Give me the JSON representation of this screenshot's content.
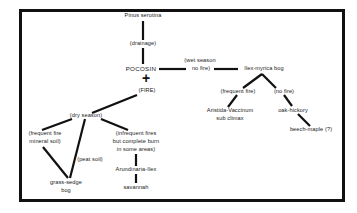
{
  "diagram": {
    "type": "succession-flowchart",
    "nodes": {
      "pinus": "Pinus serotina",
      "drainage": "(drainage)",
      "pocosin": "POCOSIN",
      "plus": "+",
      "fire": "(FIRE)",
      "wet_season_1": "(wet season",
      "wet_season_2": "no fire)",
      "ilex_myrica": "Ilex-myrica bog",
      "frequent_fire_right": "(frequent fire)",
      "no_fire": "(no fire)",
      "aristida_1": "Aristida-Vaccinum",
      "aristida_2": "sub climax",
      "oak_hickory": "oak-hickory",
      "beech_maple": "beech-maple (?)",
      "dry_season": "(dry season)",
      "freq_mineral_1": "(frequent fire",
      "freq_mineral_2": "mineral soil)",
      "peat_soil": "(peat soil)",
      "grass_sedge_1": "grass-sedge",
      "grass_sedge_2": "bog",
      "infrequent_1": "(infrequent fires",
      "infrequent_2": "but complete burn",
      "infrequent_3": "in some areas)",
      "arundinaria": "Arundinaria-Ilex",
      "savannah": "savannah"
    },
    "edges": [
      [
        "Pinus serotina",
        "(drainage)"
      ],
      [
        "(drainage)",
        "POCOSIN"
      ],
      [
        "POCOSIN",
        "(wet season no fire)"
      ],
      [
        "(wet season no fire)",
        "Ilex-myrica bog"
      ],
      [
        "Ilex-myrica bog",
        "(frequent fire)"
      ],
      [
        "Ilex-myrica bog",
        "(no fire)"
      ],
      [
        "(frequent fire)",
        "Aristida-Vaccinum sub climax"
      ],
      [
        "(no fire)",
        "oak-hickory"
      ],
      [
        "oak-hickory",
        "beech-maple (?)"
      ],
      [
        "(FIRE)",
        "(dry season)"
      ],
      [
        "(dry season)",
        "(frequent fire mineral soil)"
      ],
      [
        "(dry season)",
        "grass-sedge bog"
      ],
      [
        "(dry season)",
        "(infrequent fires but complete burn in some areas)"
      ],
      [
        "(frequent fire mineral soil)",
        "grass-sedge bog"
      ],
      [
        "(infrequent fires but complete burn in some areas)",
        "Arundinaria-Ilex"
      ],
      [
        "Arundinaria-Ilex",
        "savannah"
      ]
    ],
    "colors": {
      "ink": "#111111",
      "background": "#ffffff"
    }
  }
}
